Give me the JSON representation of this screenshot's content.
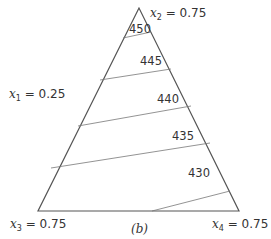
{
  "diagram": {
    "type": "simplex-contour",
    "caption": "(b)",
    "vertices": [
      {
        "id": "top",
        "var": "x",
        "sub": "2",
        "value": "= 0.75"
      },
      {
        "id": "bottom-left",
        "var": "x",
        "sub": "3",
        "value": "= 0.75"
      },
      {
        "id": "bottom-right",
        "var": "x",
        "sub": "4",
        "value": "= 0.75"
      }
    ],
    "side_label": {
      "var": "x",
      "sub": "1",
      "value": "= 0.25"
    },
    "contours": [
      {
        "label": "450"
      },
      {
        "label": "445"
      },
      {
        "label": "440"
      },
      {
        "label": "435"
      },
      {
        "label": "430"
      }
    ],
    "colors": {
      "line": "#555555",
      "text": "#333333"
    }
  }
}
